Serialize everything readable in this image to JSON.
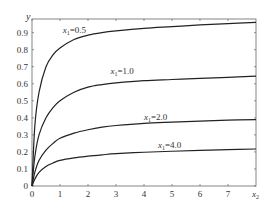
{
  "chart_data": {
    "type": "line",
    "title": "",
    "xlabel": "x2",
    "ylabel": "y",
    "xlim": [
      0,
      8
    ],
    "ylim": [
      0,
      0.98
    ],
    "grid": false,
    "x_ticks": [
      0,
      1,
      2,
      3,
      4,
      5,
      6,
      7
    ],
    "x_tick_labels": [
      "0",
      "1",
      "2",
      "3",
      "4",
      "5",
      "6",
      "7"
    ],
    "y_ticks": [
      0,
      0.1,
      0.2,
      0.3,
      0.4,
      0.5,
      0.6,
      0.7,
      0.8,
      0.9
    ],
    "y_tick_labels": [
      "0",
      "0.1",
      "0.2",
      "0.3",
      "0.4",
      "0.5",
      "0.6",
      "0.7",
      "0.8",
      "0.9"
    ],
    "x": [
      0,
      0.1,
      0.25,
      0.5,
      0.75,
      1,
      1.5,
      2,
      2.5,
      3,
      4,
      5,
      6,
      7,
      8
    ],
    "series": [
      {
        "name": "x1=0.5",
        "label_sub": "1",
        "label_val": "=0.5",
        "label_pos": [
          1.1,
          0.895
        ],
        "values": [
          0,
          0.35,
          0.55,
          0.7,
          0.77,
          0.81,
          0.86,
          0.885,
          0.9,
          0.91,
          0.925,
          0.935,
          0.945,
          0.953,
          0.96
        ]
      },
      {
        "name": "x1=1.0",
        "label_sub": "1",
        "label_val": "=1.0",
        "label_pos": [
          2.8,
          0.66
        ],
        "values": [
          0,
          0.17,
          0.3,
          0.4,
          0.46,
          0.5,
          0.55,
          0.58,
          0.595,
          0.605,
          0.618,
          0.625,
          0.632,
          0.638,
          0.645
        ]
      },
      {
        "name": "x1=2.0",
        "label_sub": "1",
        "label_val": "=2.0",
        "label_pos": [
          4.0,
          0.385
        ],
        "values": [
          0,
          0.08,
          0.15,
          0.21,
          0.25,
          0.28,
          0.31,
          0.33,
          0.345,
          0.355,
          0.368,
          0.375,
          0.381,
          0.386,
          0.39
        ]
      },
      {
        "name": "x1=4.0",
        "label_sub": "1",
        "label_val": "=4.0",
        "label_pos": [
          4.5,
          0.225
        ],
        "values": [
          0,
          0.04,
          0.08,
          0.115,
          0.135,
          0.15,
          0.165,
          0.175,
          0.183,
          0.19,
          0.198,
          0.204,
          0.209,
          0.213,
          0.217
        ]
      }
    ]
  }
}
